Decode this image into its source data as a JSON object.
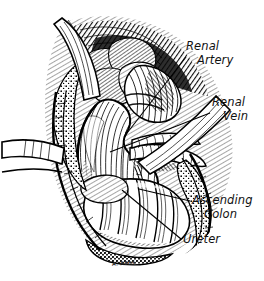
{
  "figure": {
    "medium": "pen-and-ink line drawing",
    "signature": "A. REES",
    "background_color": "#ffffff",
    "ink_color": "#000000"
  },
  "labels": [
    {
      "id": "renal-artery",
      "line1": "Renal",
      "line2": "Artery",
      "leader_from": [
        186,
        58
      ],
      "leader_to": [
        124,
        137
      ]
    },
    {
      "id": "renal-vein",
      "line1": "Renal",
      "line2": "Vein",
      "leader_from": [
        211,
        114
      ],
      "leader_to": [
        110,
        152
      ]
    },
    {
      "id": "ascending-colon",
      "line1": "Ascending",
      "line2": "Colon",
      "leader_from": [
        190,
        201
      ],
      "leader_to": [
        140,
        188
      ]
    },
    {
      "id": "ureter",
      "line1": "Ureter",
      "line2": "",
      "leader_from": [
        181,
        239
      ],
      "leader_to": [
        123,
        190
      ]
    }
  ],
  "structures": [
    {
      "id": "kidney",
      "name": "Kidney"
    },
    {
      "id": "adrenal-gland",
      "name": "Adrenal gland"
    },
    {
      "id": "renal-artery",
      "name": "Renal artery"
    },
    {
      "id": "renal-vein",
      "name": "Renal vein"
    },
    {
      "id": "ureter",
      "name": "Ureter"
    },
    {
      "id": "ascending-colon",
      "name": "Ascending colon"
    },
    {
      "id": "retractor-upper",
      "name": "Retractor blade"
    },
    {
      "id": "retractor-left",
      "name": "Retractor blade"
    },
    {
      "id": "retractor-right",
      "name": "Retractor blade"
    },
    {
      "id": "wound-edge",
      "name": "Incised abdominal wall"
    },
    {
      "id": "perirenal-fat",
      "name": "Perirenal fat"
    }
  ]
}
